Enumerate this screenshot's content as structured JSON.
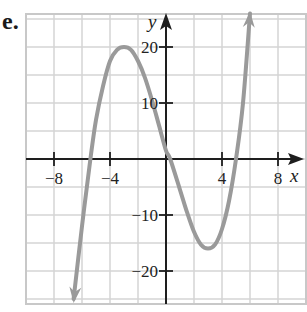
{
  "problem_label": "e.",
  "colors": {
    "grid": "#d4d4d4",
    "border": "#c8c8c8",
    "axis": "#1e1e1e",
    "curve": "#9a9a9a"
  },
  "chart_data": {
    "type": "line",
    "title": "",
    "xlabel": "x",
    "ylabel": "y",
    "xlim": [
      -10,
      10
    ],
    "ylim": [
      -25,
      26
    ],
    "grid": true,
    "legend": null,
    "x_ticks": [
      -8,
      -4,
      4,
      8
    ],
    "x_tick_labels": [
      "−8",
      "−4",
      "4",
      "8"
    ],
    "y_ticks": [
      20,
      10,
      -10,
      -20
    ],
    "y_tick_labels": [
      "20",
      "10",
      "−10",
      "−20"
    ],
    "x_grid_step": 2,
    "y_grid_step": 5,
    "series": [
      {
        "name": "f(x)",
        "description": "Cubic curve with arrows on both ends; local max near (-3, 20), local min near (3, -16); x-intercepts near -5.4, 0.3, 5",
        "x": [
          -6.6,
          -6.0,
          -5.4,
          -5.0,
          -4.5,
          -4.0,
          -3.5,
          -3.0,
          -2.5,
          -2.0,
          -1.5,
          -1.0,
          -0.5,
          0.0,
          0.3,
          1.0,
          1.5,
          2.0,
          2.5,
          3.0,
          3.5,
          4.0,
          4.5,
          5.0,
          5.5,
          6.0
        ],
        "y": [
          -25,
          -12,
          0,
          7,
          13,
          17.5,
          19.5,
          20,
          19.5,
          17.5,
          14.5,
          10.5,
          6,
          1.5,
          0,
          -5.5,
          -9.5,
          -13,
          -15.3,
          -16,
          -15.3,
          -12.5,
          -7.5,
          0,
          10,
          26
        ]
      }
    ]
  }
}
